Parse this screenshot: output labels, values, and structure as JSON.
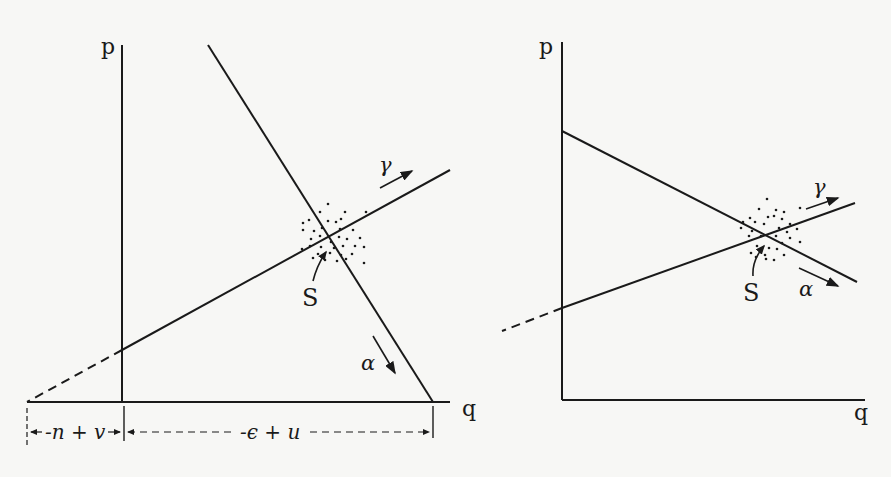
{
  "left_diagram": {
    "axes": {
      "y_label": "p",
      "x_label": "q"
    },
    "lines": {
      "gamma_label": "γ",
      "alpha_label": "α",
      "intersection_label": "S"
    },
    "dimensions": {
      "left_segment": "-n + v",
      "right_segment": "-ϵ + u"
    }
  },
  "right_diagram": {
    "axes": {
      "y_label": "p",
      "x_label": "q"
    },
    "lines": {
      "gamma_label": "γ",
      "alpha_label": "α",
      "intersection_label": "S"
    }
  },
  "colors": {
    "ink": "#1a1a1a",
    "background": "#f7f7f5"
  }
}
